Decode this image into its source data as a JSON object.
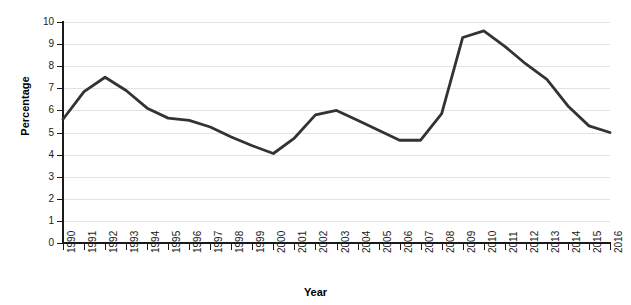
{
  "chart_data": {
    "type": "line",
    "title": "",
    "xlabel": "Year",
    "ylabel": "Percentage",
    "ylim": [
      0,
      10
    ],
    "ytick_step": 1,
    "grid": true,
    "legend": "none",
    "line_color": "#333333",
    "grid_color": "#e2e2e2",
    "axis_color": "#1a1a1a",
    "categories": [
      "1990",
      "1991",
      "1992",
      "1993",
      "1994",
      "1995",
      "1996",
      "1997",
      "1998",
      "1999",
      "2000",
      "2001",
      "2002",
      "2003",
      "2004",
      "2005",
      "2006",
      "2007",
      "2008",
      "2009",
      "2010",
      "2011",
      "2012",
      "2013",
      "2014",
      "2015",
      "2016"
    ],
    "values": [
      5.6,
      6.85,
      7.5,
      6.9,
      6.1,
      5.65,
      5.55,
      5.25,
      4.8,
      4.4,
      4.05,
      4.75,
      5.8,
      6.0,
      5.55,
      5.1,
      4.65,
      4.65,
      5.85,
      9.3,
      9.6,
      8.9,
      8.1,
      7.4,
      6.2,
      5.3,
      5.0
    ],
    "yticks": [
      "0",
      "1",
      "2",
      "3",
      "4",
      "5",
      "6",
      "7",
      "8",
      "9",
      "10"
    ]
  }
}
